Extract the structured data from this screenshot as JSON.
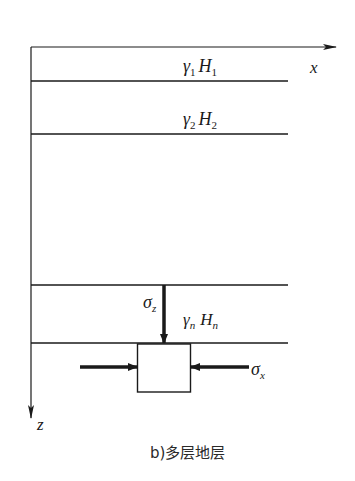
{
  "figure": {
    "caption": "b)多层地层",
    "axes": {
      "x_label": "x",
      "z_label": "z"
    },
    "layers": [
      {
        "symbol": "γ",
        "sub": "1",
        "H": "H",
        "H_sub": "1"
      },
      {
        "symbol": "γ",
        "sub": "2",
        "H": "H",
        "H_sub": "2"
      },
      {
        "symbol": "γ",
        "sub": "n",
        "H": "H",
        "H_sub": "n"
      }
    ],
    "stresses": {
      "vertical": {
        "symbol": "σ",
        "sub": "z"
      },
      "horizontal": {
        "symbol": "σ",
        "sub": "x"
      }
    },
    "colors": {
      "line": "#1a1a1a",
      "background": "#ffffff"
    }
  }
}
